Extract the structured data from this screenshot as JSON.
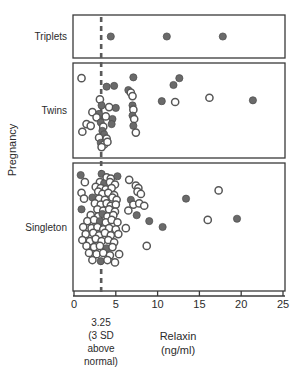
{
  "chart_data": {
    "type": "scatter",
    "title": "",
    "xlabel": "Relaxin",
    "xunits": "(ng/ml)",
    "ylabel": "Pregnancy",
    "xlim": [
      0,
      25
    ],
    "xticks": [
      0,
      5,
      10,
      15,
      20,
      25
    ],
    "xtick_labels": [
      "0",
      "5",
      "10",
      "15",
      "20",
      "25"
    ],
    "grid": false,
    "legend": "none",
    "orientation": "horizontal-strips",
    "threshold": {
      "value": 3.25,
      "label_value": "3.25",
      "label_line1": "(3 SD",
      "label_line2": "above",
      "label_line3": "normal)",
      "style": "dashed",
      "color": "#5a5a5a"
    },
    "marker_styles": {
      "filled": {
        "name": "filled-circle",
        "color": "#6a6a6a"
      },
      "open": {
        "name": "open-circle",
        "color": "#ffffff"
      }
    },
    "panels": [
      {
        "name": "Triplets",
        "label": "Triplets",
        "n": 3,
        "points": [
          {
            "x": 4.4,
            "row": 0.5,
            "marker": "filled"
          },
          {
            "x": 11.1,
            "row": 0.5,
            "marker": "filled"
          },
          {
            "x": 17.8,
            "row": 0.5,
            "marker": "filled"
          }
        ]
      },
      {
        "name": "Twins",
        "label": "Twins",
        "n": 42,
        "points": [
          {
            "x": 0.9,
            "row": 0.12,
            "marker": "open"
          },
          {
            "x": 3.9,
            "row": 0.22,
            "marker": "filled"
          },
          {
            "x": 4.8,
            "row": 0.21,
            "marker": "filled"
          },
          {
            "x": 7.1,
            "row": 0.11,
            "marker": "filled"
          },
          {
            "x": 6.5,
            "row": 0.26,
            "marker": "filled"
          },
          {
            "x": 6.8,
            "row": 0.29,
            "marker": "open"
          },
          {
            "x": 7.0,
            "row": 0.33,
            "marker": "open"
          },
          {
            "x": 11.9,
            "row": 0.2,
            "marker": "filled"
          },
          {
            "x": 12.6,
            "row": 0.12,
            "marker": "filled"
          },
          {
            "x": 3.1,
            "row": 0.37,
            "marker": "open"
          },
          {
            "x": 3.3,
            "row": 0.44,
            "marker": "filled"
          },
          {
            "x": 4.2,
            "row": 0.46,
            "marker": "open"
          },
          {
            "x": 5.0,
            "row": 0.47,
            "marker": "filled"
          },
          {
            "x": 7.0,
            "row": 0.44,
            "marker": "filled"
          },
          {
            "x": 7.1,
            "row": 0.49,
            "marker": "open"
          },
          {
            "x": 10.5,
            "row": 0.39,
            "marker": "filled"
          },
          {
            "x": 12.1,
            "row": 0.4,
            "marker": "open"
          },
          {
            "x": 16.2,
            "row": 0.35,
            "marker": "open"
          },
          {
            "x": 21.4,
            "row": 0.38,
            "marker": "filled"
          },
          {
            "x": 2.2,
            "row": 0.52,
            "marker": "open"
          },
          {
            "x": 3.0,
            "row": 0.54,
            "marker": "filled"
          },
          {
            "x": 2.7,
            "row": 0.58,
            "marker": "open"
          },
          {
            "x": 3.8,
            "row": 0.57,
            "marker": "open"
          },
          {
            "x": 4.6,
            "row": 0.6,
            "marker": "filled"
          },
          {
            "x": 7.0,
            "row": 0.56,
            "marker": "filled"
          },
          {
            "x": 7.2,
            "row": 0.6,
            "marker": "open"
          },
          {
            "x": 1.5,
            "row": 0.66,
            "marker": "open"
          },
          {
            "x": 2.0,
            "row": 0.68,
            "marker": "open"
          },
          {
            "x": 3.2,
            "row": 0.64,
            "marker": "filled"
          },
          {
            "x": 3.5,
            "row": 0.69,
            "marker": "open"
          },
          {
            "x": 4.5,
            "row": 0.66,
            "marker": "filled"
          },
          {
            "x": 7.1,
            "row": 0.68,
            "marker": "filled"
          },
          {
            "x": 1.0,
            "row": 0.75,
            "marker": "open"
          },
          {
            "x": 3.4,
            "row": 0.74,
            "marker": "filled"
          },
          {
            "x": 3.6,
            "row": 0.78,
            "marker": "filled"
          },
          {
            "x": 7.4,
            "row": 0.76,
            "marker": "open"
          },
          {
            "x": 3.0,
            "row": 0.82,
            "marker": "open"
          },
          {
            "x": 3.9,
            "row": 0.83,
            "marker": "open"
          },
          {
            "x": 3.2,
            "row": 0.88,
            "marker": "filled"
          },
          {
            "x": 3.6,
            "row": 0.9,
            "marker": "open"
          },
          {
            "x": 4.0,
            "row": 0.87,
            "marker": "open"
          },
          {
            "x": 3.3,
            "row": 0.93,
            "marker": "open"
          }
        ]
      },
      {
        "name": "Singleton",
        "label": "Singleton",
        "n": 95,
        "points": [
          {
            "x": 0.8,
            "row": 0.06,
            "marker": "filled"
          },
          {
            "x": 3.3,
            "row": 0.05,
            "marker": "filled"
          },
          {
            "x": 3.9,
            "row": 0.08,
            "marker": "open"
          },
          {
            "x": 4.4,
            "row": 0.09,
            "marker": "open"
          },
          {
            "x": 5.2,
            "row": 0.07,
            "marker": "filled"
          },
          {
            "x": 1.3,
            "row": 0.12,
            "marker": "open"
          },
          {
            "x": 3.1,
            "row": 0.12,
            "marker": "open"
          },
          {
            "x": 3.6,
            "row": 0.13,
            "marker": "filled"
          },
          {
            "x": 4.3,
            "row": 0.12,
            "marker": "open"
          },
          {
            "x": 4.9,
            "row": 0.14,
            "marker": "open"
          },
          {
            "x": 6.6,
            "row": 0.1,
            "marker": "open"
          },
          {
            "x": 2.6,
            "row": 0.16,
            "marker": "open"
          },
          {
            "x": 3.2,
            "row": 0.17,
            "marker": "open"
          },
          {
            "x": 3.8,
            "row": 0.18,
            "marker": "open"
          },
          {
            "x": 4.5,
            "row": 0.17,
            "marker": "open"
          },
          {
            "x": 7.4,
            "row": 0.15,
            "marker": "open"
          },
          {
            "x": 7.7,
            "row": 0.17,
            "marker": "open"
          },
          {
            "x": 0.9,
            "row": 0.21,
            "marker": "open"
          },
          {
            "x": 2.9,
            "row": 0.2,
            "marker": "open"
          },
          {
            "x": 3.4,
            "row": 0.22,
            "marker": "open"
          },
          {
            "x": 4.1,
            "row": 0.21,
            "marker": "open"
          },
          {
            "x": 4.8,
            "row": 0.23,
            "marker": "open"
          },
          {
            "x": 7.6,
            "row": 0.2,
            "marker": "open"
          },
          {
            "x": 8.0,
            "row": 0.22,
            "marker": "open"
          },
          {
            "x": 17.3,
            "row": 0.19,
            "marker": "open"
          },
          {
            "x": 1.2,
            "row": 0.26,
            "marker": "open"
          },
          {
            "x": 2.2,
            "row": 0.25,
            "marker": "filled"
          },
          {
            "x": 3.0,
            "row": 0.26,
            "marker": "open"
          },
          {
            "x": 3.7,
            "row": 0.27,
            "marker": "open"
          },
          {
            "x": 4.6,
            "row": 0.25,
            "marker": "open"
          },
          {
            "x": 5.1,
            "row": 0.27,
            "marker": "open"
          },
          {
            "x": 6.8,
            "row": 0.27,
            "marker": "filled"
          },
          {
            "x": 13.4,
            "row": 0.26,
            "marker": "filled"
          },
          {
            "x": 2.5,
            "row": 0.3,
            "marker": "open"
          },
          {
            "x": 3.2,
            "row": 0.31,
            "marker": "open"
          },
          {
            "x": 3.9,
            "row": 0.3,
            "marker": "open"
          },
          {
            "x": 4.4,
            "row": 0.32,
            "marker": "open"
          },
          {
            "x": 5.0,
            "row": 0.31,
            "marker": "open"
          },
          {
            "x": 7.1,
            "row": 0.31,
            "marker": "open"
          },
          {
            "x": 7.8,
            "row": 0.3,
            "marker": "open"
          },
          {
            "x": 8.4,
            "row": 0.32,
            "marker": "open"
          },
          {
            "x": 0.9,
            "row": 0.35,
            "marker": "filled"
          },
          {
            "x": 2.8,
            "row": 0.35,
            "marker": "open"
          },
          {
            "x": 3.5,
            "row": 0.36,
            "marker": "open"
          },
          {
            "x": 4.2,
            "row": 0.35,
            "marker": "open"
          },
          {
            "x": 4.9,
            "row": 0.37,
            "marker": "open"
          },
          {
            "x": 6.5,
            "row": 0.36,
            "marker": "open"
          },
          {
            "x": 2.0,
            "row": 0.4,
            "marker": "open"
          },
          {
            "x": 2.9,
            "row": 0.41,
            "marker": "open"
          },
          {
            "x": 3.4,
            "row": 0.39,
            "marker": "filled"
          },
          {
            "x": 4.0,
            "row": 0.41,
            "marker": "open"
          },
          {
            "x": 4.7,
            "row": 0.4,
            "marker": "open"
          },
          {
            "x": 7.5,
            "row": 0.4,
            "marker": "filled"
          },
          {
            "x": 1.6,
            "row": 0.45,
            "marker": "open"
          },
          {
            "x": 2.4,
            "row": 0.44,
            "marker": "open"
          },
          {
            "x": 3.1,
            "row": 0.45,
            "marker": "filled"
          },
          {
            "x": 3.8,
            "row": 0.46,
            "marker": "open"
          },
          {
            "x": 4.5,
            "row": 0.44,
            "marker": "open"
          },
          {
            "x": 5.2,
            "row": 0.46,
            "marker": "open"
          },
          {
            "x": 9.0,
            "row": 0.45,
            "marker": "filled"
          },
          {
            "x": 16.0,
            "row": 0.44,
            "marker": "open"
          },
          {
            "x": 19.5,
            "row": 0.43,
            "marker": "filled"
          },
          {
            "x": 1.1,
            "row": 0.5,
            "marker": "open"
          },
          {
            "x": 2.1,
            "row": 0.51,
            "marker": "open"
          },
          {
            "x": 2.8,
            "row": 0.5,
            "marker": "open"
          },
          {
            "x": 3.5,
            "row": 0.52,
            "marker": "open"
          },
          {
            "x": 4.2,
            "row": 0.51,
            "marker": "open"
          },
          {
            "x": 5.0,
            "row": 0.52,
            "marker": "open"
          },
          {
            "x": 6.2,
            "row": 0.51,
            "marker": "open"
          },
          {
            "x": 10.6,
            "row": 0.5,
            "marker": "filled"
          },
          {
            "x": 1.4,
            "row": 0.56,
            "marker": "open"
          },
          {
            "x": 2.3,
            "row": 0.55,
            "marker": "open"
          },
          {
            "x": 3.0,
            "row": 0.57,
            "marker": "open"
          },
          {
            "x": 3.7,
            "row": 0.55,
            "marker": "open"
          },
          {
            "x": 4.4,
            "row": 0.57,
            "marker": "open"
          },
          {
            "x": 5.3,
            "row": 0.56,
            "marker": "open"
          },
          {
            "x": 1.0,
            "row": 0.61,
            "marker": "open"
          },
          {
            "x": 1.9,
            "row": 0.62,
            "marker": "open"
          },
          {
            "x": 2.6,
            "row": 0.6,
            "marker": "open"
          },
          {
            "x": 3.3,
            "row": 0.62,
            "marker": "open"
          },
          {
            "x": 4.1,
            "row": 0.61,
            "marker": "open"
          },
          {
            "x": 4.8,
            "row": 0.63,
            "marker": "open"
          },
          {
            "x": 1.5,
            "row": 0.66,
            "marker": "open"
          },
          {
            "x": 2.4,
            "row": 0.67,
            "marker": "open"
          },
          {
            "x": 3.1,
            "row": 0.66,
            "marker": "open"
          },
          {
            "x": 3.9,
            "row": 0.68,
            "marker": "filled"
          },
          {
            "x": 4.6,
            "row": 0.67,
            "marker": "open"
          },
          {
            "x": 8.7,
            "row": 0.66,
            "marker": "open"
          },
          {
            "x": 1.8,
            "row": 0.72,
            "marker": "open"
          },
          {
            "x": 2.7,
            "row": 0.73,
            "marker": "open"
          },
          {
            "x": 3.5,
            "row": 0.72,
            "marker": "open"
          },
          {
            "x": 4.3,
            "row": 0.74,
            "marker": "open"
          },
          {
            "x": 5.4,
            "row": 0.73,
            "marker": "open"
          },
          {
            "x": 2.2,
            "row": 0.78,
            "marker": "open"
          },
          {
            "x": 3.2,
            "row": 0.79,
            "marker": "filled"
          },
          {
            "x": 4.0,
            "row": 0.78,
            "marker": "open"
          },
          {
            "x": 4.9,
            "row": 0.8,
            "marker": "open"
          }
        ]
      }
    ]
  },
  "geometry": {
    "plot_left": 73,
    "plot_right": 285,
    "x0_px": 74,
    "x25_px": 283,
    "panels_px": [
      {
        "name": "Triplets",
        "top": 15,
        "bottom": 58
      },
      {
        "name": "Twins",
        "top": 63,
        "bottom": 158
      },
      {
        "name": "Singleton",
        "top": 163,
        "bottom": 291
      }
    ],
    "axis_y": 296,
    "tick_len": 5,
    "marker_radius": 3.6
  }
}
